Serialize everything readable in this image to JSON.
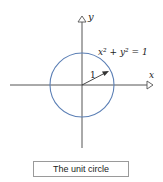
{
  "diagram": {
    "x_axis_label": "x",
    "y_axis_label": "y",
    "equation": "x² + y² = 1",
    "radius_label": "1",
    "caption": "The unit circle",
    "colors": {
      "circle": "#5b7fb5",
      "axis": "#444444",
      "text": "#222222"
    }
  }
}
